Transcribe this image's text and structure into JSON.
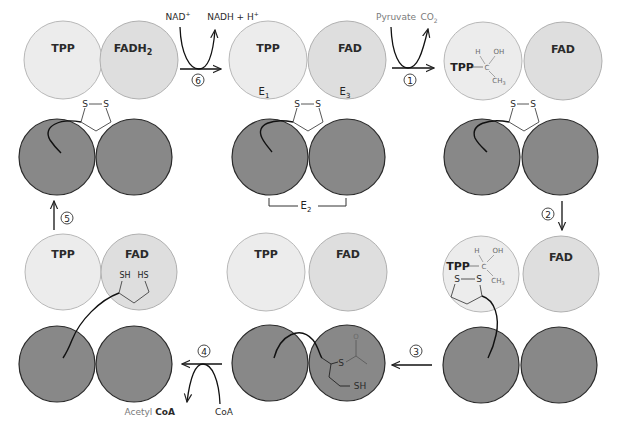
{
  "colors": {
    "e1_fill": "#ececec",
    "e3_fill": "#e0e0e0",
    "e2_fill": "#8a8a8a",
    "outline": "#2a2a2a",
    "light_outline": "#b0b0b0"
  },
  "labels": {
    "tpp": "TPP",
    "fad": "FAD",
    "fadh2": "FADH",
    "fadh2_sub": "2",
    "e1": "E",
    "e1_sub": "1",
    "e3": "E",
    "e3_sub": "3",
    "e2": "E",
    "e2_sub": "2",
    "s": "S",
    "sh": "SH",
    "hs": "HS",
    "h": "H",
    "oh": "OH",
    "c": "C",
    "ch3": "CH",
    "ch3_sub": "3",
    "o": "O",
    "tpp_bond": "TPP"
  },
  "reactions": {
    "step1": {
      "number": "1",
      "in": "Pyruvate",
      "out": "CO",
      "out_sub": "2"
    },
    "step2": {
      "number": "2"
    },
    "step3": {
      "number": "3"
    },
    "step4": {
      "number": "4",
      "in": "CoA",
      "out_prefix": "Acetyl",
      "out": "CoA"
    },
    "step5": {
      "number": "5"
    },
    "step6": {
      "number": "6",
      "in": "NAD",
      "in_sup": "+",
      "out": "NADH + H",
      "out_sup": "+"
    }
  },
  "panels": [
    {
      "id": "oxidized-start",
      "e1": "TPP",
      "e3": "FAD",
      "lipoamide": "disulfide"
    },
    {
      "id": "hydroxyethyl-tpp",
      "e1": "TPP-hydroxyethyl",
      "e3": "FAD",
      "lipoamide": "disulfide"
    },
    {
      "id": "lipoamide-attack",
      "e1": "TPP-hydroxyethyl + lipoamide",
      "e3": "FAD"
    },
    {
      "id": "acetyl-lipoamide",
      "e1": "TPP",
      "e3": "FAD",
      "lipoamide": "acetyl-dihydrolipoamide"
    },
    {
      "id": "reduced-lipoamide",
      "e1": "TPP",
      "e3": "FAD",
      "lipoamide": "dihydrolipoamide"
    },
    {
      "id": "fadh2",
      "e1": "TPP",
      "e3": "FADH2",
      "lipoamide": "disulfide"
    }
  ]
}
